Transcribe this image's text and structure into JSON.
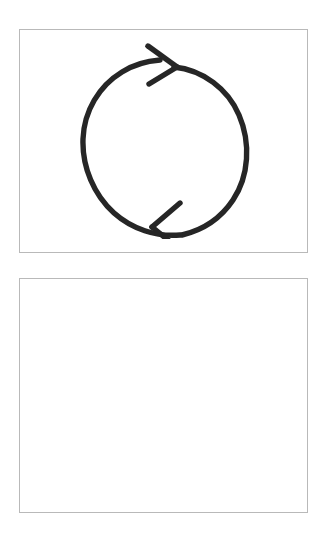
{
  "page": {
    "background_color": "#ffffff",
    "width": 329,
    "height": 543
  },
  "panels": [
    {
      "name": "top-panel",
      "border_color": "#b9b9b9",
      "background_color": "#ffffff",
      "content_type": "drawing",
      "content_label": "cycle-arrow-icon",
      "empty": false
    },
    {
      "name": "bottom-panel",
      "border_color": "#b9b9b9",
      "background_color": "#ffffff",
      "content_type": "blank",
      "content_label": "",
      "empty": true
    }
  ],
  "drawing": {
    "icon_name": "circular-cycle-arrow",
    "description": "Hand-drawn clockwise circular arrow with two arrowheads",
    "stroke_color": "#262626",
    "stroke_width": 5,
    "direction": "clockwise",
    "arrowhead_count": 2,
    "arrowhead_top_direction": "right",
    "arrowhead_bottom_direction": "left"
  }
}
